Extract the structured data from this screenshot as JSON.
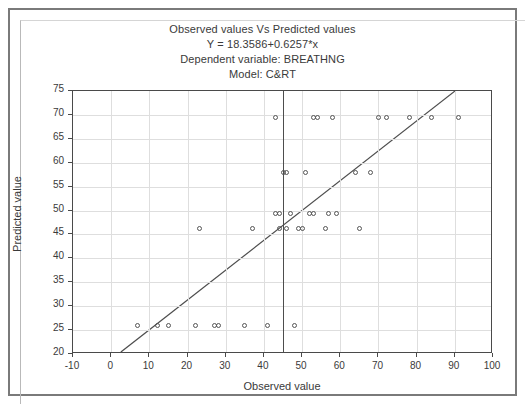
{
  "chart_data": {
    "type": "scatter",
    "title": "Observed values Vs Predicted values",
    "subtitle_equation": "Y = 18.3586+0.6257*x",
    "subtitle_dependent": "Dependent variable: BREATHNG",
    "subtitle_model": "Model: C&RT",
    "xlabel": "Observed value",
    "ylabel": "Predicted value",
    "xlim": [
      -10,
      100
    ],
    "ylim": [
      20,
      75
    ],
    "xticks": [
      -10,
      0,
      10,
      20,
      30,
      40,
      50,
      60,
      70,
      80,
      90,
      100
    ],
    "yticks": [
      20,
      25,
      30,
      35,
      40,
      45,
      50,
      55,
      60,
      65,
      70,
      75
    ],
    "grid": true,
    "legend": "none",
    "marker": "open-circle",
    "colors": {
      "marker_stroke": "#555555",
      "fit_line": "#4d4d4d",
      "reference_line": "#4d4d4d",
      "grid": "#dedede",
      "axis": "#4a4a4a",
      "text": "#3a3a3a",
      "background": "#ffffff",
      "outer_frame": "#7a7a7a"
    },
    "fit_line": {
      "intercept": 18.3586,
      "slope": 0.6257,
      "x_start": 2.6,
      "x_end": 90.5
    },
    "reference_line_x": 45.0,
    "points": [
      {
        "x": 7,
        "y": 26.0
      },
      {
        "x": 12,
        "y": 26.0
      },
      {
        "x": 15,
        "y": 26.0
      },
      {
        "x": 22,
        "y": 26.0
      },
      {
        "x": 27,
        "y": 26.0
      },
      {
        "x": 28,
        "y": 26.0
      },
      {
        "x": 35,
        "y": 26.0
      },
      {
        "x": 41,
        "y": 26.0
      },
      {
        "x": 48,
        "y": 26.0
      },
      {
        "x": 23,
        "y": 46.2
      },
      {
        "x": 37,
        "y": 46.2
      },
      {
        "x": 44,
        "y": 46.2
      },
      {
        "x": 46,
        "y": 46.2
      },
      {
        "x": 49,
        "y": 46.2
      },
      {
        "x": 50,
        "y": 46.2
      },
      {
        "x": 56,
        "y": 46.2
      },
      {
        "x": 65,
        "y": 46.2
      },
      {
        "x": 43,
        "y": 49.4
      },
      {
        "x": 44,
        "y": 49.4
      },
      {
        "x": 47,
        "y": 49.4
      },
      {
        "x": 52,
        "y": 49.4
      },
      {
        "x": 53,
        "y": 49.4
      },
      {
        "x": 57,
        "y": 49.4
      },
      {
        "x": 59,
        "y": 49.4
      },
      {
        "x": 45,
        "y": 58.0
      },
      {
        "x": 46,
        "y": 58.0
      },
      {
        "x": 51,
        "y": 58.0
      },
      {
        "x": 64,
        "y": 58.0
      },
      {
        "x": 68,
        "y": 58.0
      },
      {
        "x": 43,
        "y": 69.5
      },
      {
        "x": 53,
        "y": 69.5
      },
      {
        "x": 54,
        "y": 69.5
      },
      {
        "x": 58,
        "y": 69.5
      },
      {
        "x": 70,
        "y": 69.5
      },
      {
        "x": 72,
        "y": 69.5
      },
      {
        "x": 78,
        "y": 69.5
      },
      {
        "x": 84,
        "y": 69.5
      },
      {
        "x": 91,
        "y": 69.5
      }
    ]
  }
}
